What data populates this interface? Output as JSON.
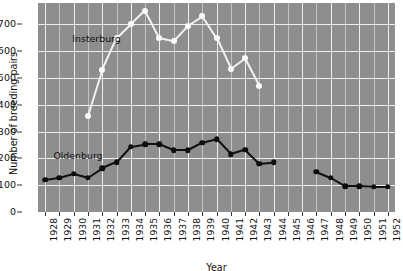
{
  "chart_data": {
    "type": "line",
    "title": "",
    "xlabel": "Year",
    "ylabel": "Number of breeding pairs",
    "x": [
      1928,
      1929,
      1930,
      1931,
      1932,
      1933,
      1934,
      1935,
      1936,
      1937,
      1938,
      1939,
      1940,
      1941,
      1942,
      1943,
      1944,
      1945,
      1946,
      1947,
      1948,
      1949,
      1950,
      1951,
      1952
    ],
    "xlim": [
      1927.5,
      1952.5
    ],
    "ylim": [
      0,
      780
    ],
    "yticks": [
      0,
      100,
      200,
      300,
      400,
      500,
      600,
      700
    ],
    "xticks": [
      "1928",
      "1929",
      "1930",
      "1931",
      "1932",
      "1933",
      "1934",
      "1935",
      "1936",
      "1937",
      "1938",
      "1939",
      "1940",
      "1941",
      "1942",
      "1943",
      "1944",
      "1945",
      "1946",
      "1947",
      "1948",
      "1949",
      "1950",
      "1951",
      "1952"
    ],
    "grid": true,
    "legend": "inline-annotations",
    "plot_background": "#8e8e8e",
    "series": [
      {
        "name": "Insterburg",
        "color": "#fbfbfb",
        "label_x": 1931.6,
        "label_y": 648,
        "points": [
          {
            "x": 1931,
            "y": 360
          },
          {
            "x": 1932,
            "y": 530
          },
          {
            "x": 1933,
            "y": 648
          },
          {
            "x": 1934,
            "y": 700
          },
          {
            "x": 1935,
            "y": 752
          },
          {
            "x": 1936,
            "y": 650
          },
          {
            "x": 1937,
            "y": 638
          },
          {
            "x": 1938,
            "y": 695
          },
          {
            "x": 1939,
            "y": 730
          },
          {
            "x": 1940,
            "y": 648
          },
          {
            "x": 1941,
            "y": 533
          },
          {
            "x": 1942,
            "y": 573
          },
          {
            "x": 1943,
            "y": 470
          }
        ]
      },
      {
        "name": "Oldenburg",
        "color": "#0d0d0d",
        "label_x": 1930.3,
        "label_y": 213,
        "segments": [
          [
            {
              "x": 1928,
              "y": 120
            },
            {
              "x": 1929,
              "y": 128
            },
            {
              "x": 1930,
              "y": 143
            },
            {
              "x": 1931,
              "y": 128
            },
            {
              "x": 1932,
              "y": 163
            },
            {
              "x": 1933,
              "y": 185
            },
            {
              "x": 1934,
              "y": 243
            },
            {
              "x": 1935,
              "y": 252
            },
            {
              "x": 1936,
              "y": 252
            },
            {
              "x": 1937,
              "y": 230
            },
            {
              "x": 1938,
              "y": 230
            },
            {
              "x": 1939,
              "y": 258
            },
            {
              "x": 1940,
              "y": 272
            },
            {
              "x": 1941,
              "y": 215
            },
            {
              "x": 1942,
              "y": 232
            },
            {
              "x": 1943,
              "y": 180
            },
            {
              "x": 1944,
              "y": 185
            }
          ],
          [
            {
              "x": 1947,
              "y": 150
            },
            {
              "x": 1948,
              "y": 128
            },
            {
              "x": 1949,
              "y": 97
            },
            {
              "x": 1950,
              "y": 97
            },
            {
              "x": 1951,
              "y": 95
            },
            {
              "x": 1952,
              "y": 95
            }
          ]
        ]
      }
    ]
  }
}
